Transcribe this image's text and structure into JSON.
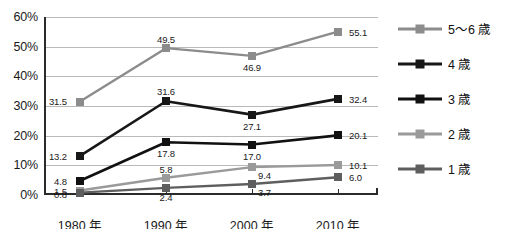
{
  "chart_data": {
    "type": "line",
    "title": "",
    "subtitle": "",
    "xlabel": "",
    "ylabel": "",
    "categories": [
      "1980 年",
      "1990 年",
      "2000 年",
      "2010 年"
    ],
    "ylim": [
      0,
      60
    ],
    "ytick_labels": [
      "0%",
      "10%",
      "20%",
      "30%",
      "40%",
      "50%",
      "60%"
    ],
    "ytick_values": [
      0,
      10,
      20,
      30,
      40,
      50,
      60
    ],
    "grid": true,
    "legend_position": "right",
    "value_labels_shown": true,
    "series": [
      {
        "name": "5～6 歳",
        "color": "#8c8c8c",
        "values": [
          31.5,
          49.5,
          46.9,
          55.1
        ],
        "labels": [
          "31.5",
          "49.5",
          "46.9",
          "55.1"
        ]
      },
      {
        "name": "4 歳",
        "color": "#171717",
        "values": [
          13.2,
          31.6,
          27.1,
          32.4
        ],
        "labels": [
          "13.2",
          "31.6",
          "27.1",
          "32.4"
        ]
      },
      {
        "name": "3 歳",
        "color": "#111111",
        "values": [
          4.8,
          17.8,
          17.0,
          20.1
        ],
        "labels": [
          "4.8",
          "17.8",
          "17.0",
          "20.1"
        ]
      },
      {
        "name": "2 歳",
        "color": "#9a9a9a",
        "values": [
          1.5,
          5.8,
          9.4,
          10.1
        ],
        "labels": [
          "1.5",
          "5.8",
          "9.4",
          "10.1"
        ]
      },
      {
        "name": "1 歳",
        "color": "#5e5e5e",
        "values": [
          0.8,
          2.4,
          3.7,
          6.0
        ],
        "labels": [
          "0.8",
          "2.4",
          "3.7",
          "6.0"
        ]
      }
    ]
  },
  "legend": {
    "items": [
      {
        "label": "5～6 歳"
      },
      {
        "label": "4 歳"
      },
      {
        "label": "3 歳"
      },
      {
        "label": "2 歳"
      },
      {
        "label": "1 歳"
      }
    ]
  },
  "colors": {
    "background": "#ffffff",
    "axis": "#2b2b2b",
    "gridline": "#b9b9b9",
    "text": "#1a1a1a"
  }
}
